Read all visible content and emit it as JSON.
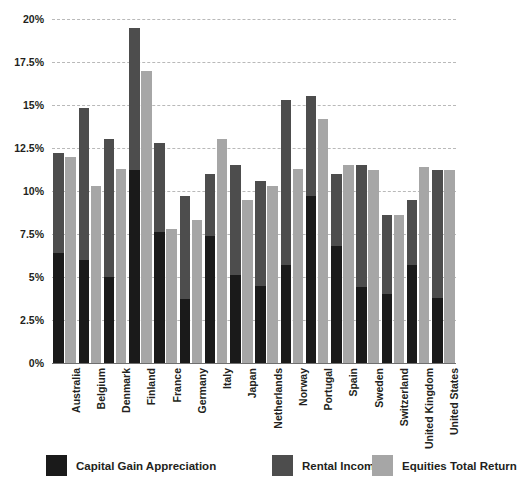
{
  "chart_data": {
    "type": "bar",
    "title": "",
    "subtitle": "",
    "xlabel": "",
    "ylabel": "",
    "ylim": [
      0,
      20
    ],
    "grid": true,
    "legend_position": "bottom",
    "ytick_labels": [
      "20%",
      "17.5%",
      "15%",
      "12.5%",
      "10%",
      "7.5%",
      "5%",
      "2.5%",
      "0%"
    ],
    "ytick_values": [
      20,
      17.5,
      15,
      12.5,
      10,
      7.5,
      5,
      2.5,
      0
    ],
    "categories": [
      "Australia",
      "Belgium",
      "Denmark",
      "Finland",
      "France",
      "Germany",
      "Italy",
      "Japan",
      "Netherlands",
      "Norway",
      "Portugal",
      "Spain",
      "Sweden",
      "Switzerland",
      "United Kingdom",
      "United States"
    ],
    "series": [
      {
        "name": "Capital Gain Appreciation",
        "color": "#1a1a1a",
        "values": [
          6.4,
          6.0,
          5.0,
          11.2,
          7.6,
          3.7,
          7.4,
          5.1,
          4.5,
          5.7,
          9.7,
          6.8,
          4.4,
          4.0,
          5.7,
          3.8
        ]
      },
      {
        "name": "Rental Income",
        "color": "#4d4d4d",
        "values": [
          12.2,
          14.8,
          13.0,
          19.5,
          12.8,
          9.7,
          11.0,
          11.5,
          10.6,
          15.3,
          15.5,
          11.0,
          11.5,
          8.6,
          9.5,
          11.2
        ]
      },
      {
        "name": "Equities Total Return",
        "color": "#a6a6a6",
        "values": [
          12.0,
          10.3,
          11.3,
          17.0,
          7.8,
          8.3,
          13.0,
          9.5,
          10.3,
          11.3,
          14.2,
          11.5,
          11.2,
          8.6,
          11.4,
          11.2
        ]
      }
    ]
  },
  "legend": {
    "items": [
      {
        "label": "Capital Gain Appreciation",
        "color": "#1a1a1a"
      },
      {
        "label": "Rental Income",
        "color": "#4d4d4d"
      },
      {
        "label": "Equities Total Return",
        "color": "#a6a6a6"
      }
    ]
  }
}
